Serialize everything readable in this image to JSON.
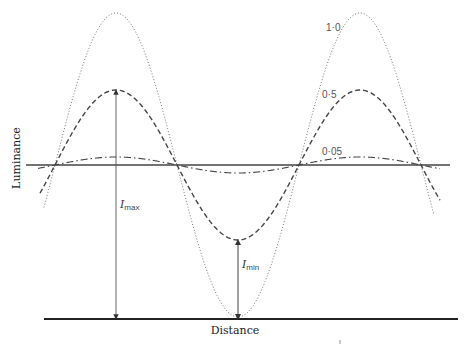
{
  "figure": {
    "xlabel": "Distance",
    "ylabel": "Luminance",
    "curves": [
      {
        "label": "1·0",
        "style": "dotted",
        "amplitude": 152
      },
      {
        "label": "0·5",
        "style": "dashed",
        "amplitude": 75
      },
      {
        "label": "0·05",
        "style": "dash-dot",
        "amplitude": 8
      }
    ],
    "annotations": {
      "imax": {
        "symbol": "I",
        "sub": "max"
      },
      "imin": {
        "symbol": "I",
        "sub": "min"
      }
    }
  }
}
